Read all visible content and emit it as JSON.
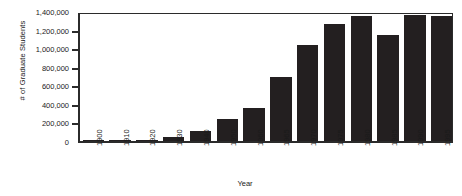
{
  "chart_data": {
    "type": "bar",
    "title": "",
    "xlabel": "Year",
    "ylabel": "# of Graduate Students",
    "categories": [
      "1900",
      "1910",
      "1920",
      "1930",
      "1940",
      "1950",
      "1960",
      "1965",
      "1970",
      "1975",
      "1980",
      "1985",
      "1990",
      "1995"
    ],
    "values": [
      5000,
      9000,
      16000,
      47000,
      106000,
      237000,
      356000,
      690000,
      1031000,
      1263000,
      1343000,
      1139000,
      1352000,
      1345000
    ],
    "ylim": [
      0,
      1400000
    ],
    "ytick_labels": [
      "1,400,000",
      "1,200,000",
      "1,000,000",
      "800,000",
      "600,000",
      "400,000",
      "200,000",
      "0"
    ],
    "ytick_values": [
      1400000,
      1200000,
      1000000,
      800000,
      600000,
      400000,
      200000,
      0
    ],
    "grid": false,
    "legend": false,
    "bar_color": "#231f20"
  }
}
